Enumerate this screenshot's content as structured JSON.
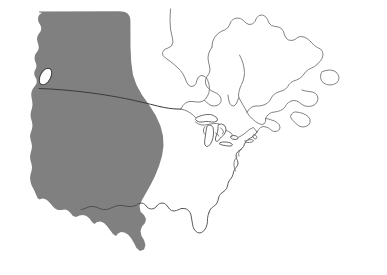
{
  "figure": {
    "kind": "map",
    "width": 387,
    "height": 275,
    "background_color": "#ffffff"
  },
  "style": {
    "land_outline_color": "#6e6e6e",
    "coast_dark_color": "#4a4a4a",
    "shaded_region_fill": "#808080",
    "shaded_region_fill_alt": "#7b7b7b",
    "border_line_color": "#3a3a3a",
    "lake_fill": "#ffffff",
    "lake_stroke": "#4f4f4f",
    "stroke_width": 0.85
  },
  "layers": {
    "continent_outline": {
      "name": "North America coastline",
      "visible": true,
      "fill": "none",
      "stroke": "#6e6e6e"
    },
    "shaded_region": {
      "name": "Western North America shaded area",
      "visible": true,
      "fill": "#808080",
      "coverage": "Pacific coast and interior west, spanning western Canada and the western United States"
    },
    "international_border": {
      "name": "Canada-United States border (49th parallel)",
      "visible": true,
      "stroke": "#3a3a3a"
    },
    "great_lakes": {
      "name": "Great Lakes",
      "visible": true,
      "lakes": [
        "Lake Superior",
        "Lake Michigan",
        "Lake Huron",
        "Lake Erie",
        "Lake Ontario"
      ]
    },
    "islands": {
      "name": "Coastal islands",
      "visible": true,
      "items": [
        "Vancouver Island"
      ]
    }
  },
  "features": {
    "water_bodies": [
      "Hudson Bay",
      "Gulf of Mexico",
      "Gulf of St. Lawrence",
      "Chesapeake Bay",
      "Pacific Ocean",
      "Atlantic Ocean"
    ],
    "landmasses": [
      "Canada",
      "United States",
      "Mexico (northern)",
      "Labrador",
      "Newfoundland",
      "Nova Scotia",
      "Florida Peninsula",
      "Baja California"
    ]
  },
  "labels": {
    "visible_text": []
  }
}
